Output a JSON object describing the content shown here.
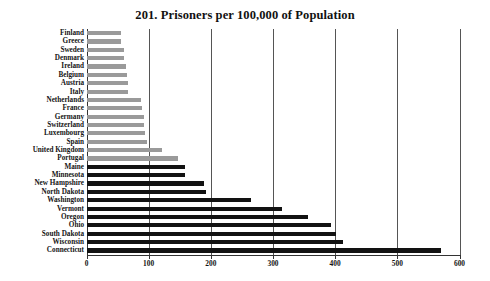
{
  "chart_data": {
    "type": "bar",
    "orientation": "horizontal",
    "title": "201. Prisoners per 100,000 of Population",
    "xlabel": "",
    "ylabel": "",
    "xlim": [
      0,
      600
    ],
    "xticks": [
      0,
      100,
      200,
      300,
      400,
      500,
      600
    ],
    "xticklabels": [
      "0",
      "100",
      "200",
      "300",
      "400",
      "500",
      "600"
    ],
    "grid": true,
    "grid_axis": "x",
    "legend": null,
    "categories": [
      "Finland",
      "Greece",
      "Sweden",
      "Denmark",
      "Ireland",
      "Belgium",
      "Austria",
      "Italy",
      "Netherlands",
      "France",
      "Germany",
      "Switzerland",
      "Luxembourg",
      "Spain",
      "United Kingdom",
      "Portugal",
      "Maine",
      "Minnesota",
      "New Hampshire",
      "North Dakota",
      "Washington",
      "Vermont",
      "Oregon",
      "Ohio",
      "South Dakota",
      "Wisconsin",
      "Connecticut"
    ],
    "values": [
      55,
      56,
      60,
      61,
      63,
      65,
      66,
      67,
      87,
      89,
      92,
      93,
      94,
      98,
      122,
      147,
      158,
      159,
      189,
      192,
      265,
      314,
      357,
      394,
      401,
      413,
      570
    ],
    "bar_colors": [
      "#9a9a9a",
      "#9a9a9a",
      "#9a9a9a",
      "#9a9a9a",
      "#9a9a9a",
      "#9a9a9a",
      "#9a9a9a",
      "#9a9a9a",
      "#9a9a9a",
      "#9a9a9a",
      "#9a9a9a",
      "#9a9a9a",
      "#9a9a9a",
      "#9a9a9a",
      "#9a9a9a",
      "#9a9a9a",
      "#121212",
      "#121212",
      "#121212",
      "#121212",
      "#121212",
      "#121212",
      "#121212",
      "#121212",
      "#121212",
      "#121212",
      "#121212"
    ],
    "colors": {
      "countries": "#9a9a9a",
      "us_states": "#121212",
      "gridline": "#555555",
      "axis": "#333333",
      "background": "#ffffff",
      "text": "#141414"
    }
  }
}
